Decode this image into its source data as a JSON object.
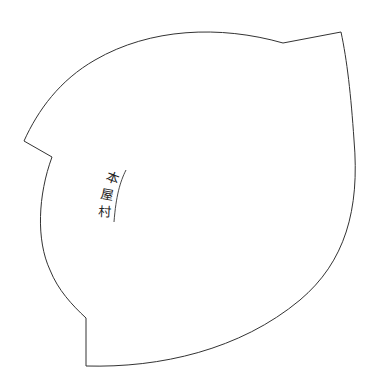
{
  "map": {
    "region_label": "本屋村",
    "label_chars": [
      "本",
      "屋",
      "村"
    ],
    "colors": {
      "background": "#ffffff",
      "boundary_stroke": "#333333",
      "label": "#222222"
    }
  }
}
